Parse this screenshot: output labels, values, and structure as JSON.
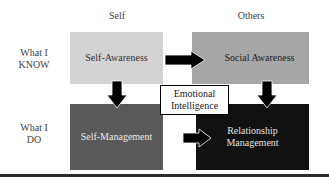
{
  "diagram": {
    "columns": [
      "Self",
      "Others"
    ],
    "rows": [
      "What I\nKNOW",
      "What I\nDO"
    ],
    "row_labels": [
      {
        "line1": "What I",
        "line2": "KNOW"
      },
      {
        "line1": "What I",
        "line2": "DO"
      }
    ],
    "quadrants": [
      {
        "id": "self-awareness",
        "label": "Self-Awareness",
        "row": 0,
        "col": 0,
        "color": "#d3d3d3"
      },
      {
        "id": "social-awareness",
        "label": "Social Awareness",
        "row": 0,
        "col": 1,
        "color": "#a6a6a6"
      },
      {
        "id": "self-management",
        "label": "Self-Management",
        "row": 1,
        "col": 0,
        "color": "#595959"
      },
      {
        "id": "relationship-management",
        "label_line1": "Relationship",
        "label_line2": "Management",
        "row": 1,
        "col": 1,
        "color": "#111111"
      }
    ],
    "center": {
      "line1": "Emotional",
      "line2": "Intelligence"
    },
    "arrows": [
      {
        "from": "self-awareness",
        "to": "social-awareness",
        "direction": "right"
      },
      {
        "from": "self-awareness",
        "to": "self-management",
        "direction": "down"
      },
      {
        "from": "social-awareness",
        "to": "relationship-management",
        "direction": "down"
      },
      {
        "from": "self-management",
        "to": "relationship-management",
        "direction": "right"
      }
    ]
  }
}
